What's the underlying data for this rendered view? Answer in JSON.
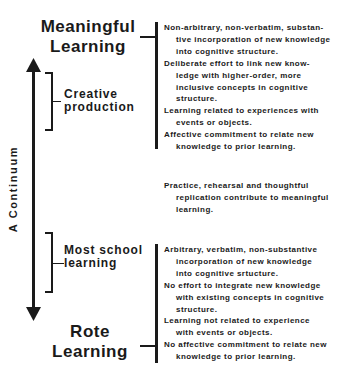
{
  "top": {
    "title_line1": "Meaningful",
    "title_line2": "Learning",
    "items": [
      {
        "line1": "Non-arbitrary, non-verbatim, substan-",
        "rest": [
          "tive incorporation of new knowledge",
          "into cognitive structure."
        ]
      },
      {
        "line1": "Deliberate effort to link new know-",
        "rest": [
          "ledge with higher-order, more",
          "inclusive concepts in cognitive",
          "structure."
        ]
      },
      {
        "line1": "Learning related to experiences with",
        "rest": [
          "events or objects."
        ]
      },
      {
        "line1": "Affective commitment to relate new",
        "rest": [
          "knowledge to prior learning."
        ]
      }
    ]
  },
  "creative": {
    "line1": "Creative",
    "line2": "production"
  },
  "axis": {
    "label": "A Continuum",
    "icon_up": "arrow-up-icon",
    "icon_down": "arrow-down-icon"
  },
  "middle": {
    "line1": "Practice, rehearsal and thoughtful",
    "rest": [
      "replication contribute to meaningful",
      "learning."
    ]
  },
  "school": {
    "line1": "Most school",
    "line2": "learning"
  },
  "bottom": {
    "title_line1": "Rote",
    "title_line2": "Learning",
    "items": [
      {
        "line1": "Arbitrary, verbatim, non-substantive",
        "rest": [
          "incorporation of new knowledge",
          "into cognitive srtucture."
        ]
      },
      {
        "line1": "No effort to integrate new knowledge",
        "rest": [
          "with existing concepts in cognitive",
          "structure."
        ]
      },
      {
        "line1": "Learning not related to experience",
        "rest": [
          "with events or objects."
        ]
      },
      {
        "line1": "No affective commitment to relate new",
        "rest": [
          "knowledge to prior learning."
        ]
      }
    ]
  },
  "colors": {
    "ink": "#1a1a1a",
    "background": "#ffffff"
  }
}
